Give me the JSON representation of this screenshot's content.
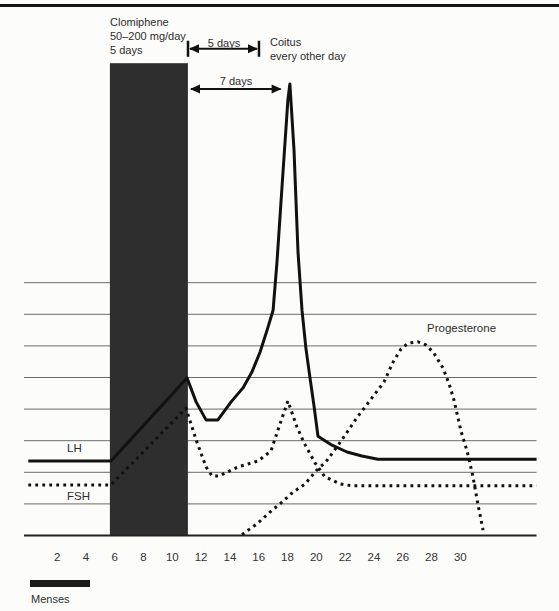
{
  "figure": {
    "annotations": {
      "clomiphene": {
        "line1": "Clomiphene",
        "line2": "50–200 mg/day",
        "line3": "5 days"
      },
      "five_days_arrow_label": "5 days",
      "coitus": {
        "line1": "Coitus",
        "line2": "every other day"
      },
      "seven_days_arrow_label": "7 days",
      "menses_label": "Menses"
    },
    "series_labels": {
      "lh": "LH",
      "fsh": "FSH",
      "progesterone": "Progesterone"
    },
    "colors": {
      "ink": "#111111",
      "treatment_bar": "#2e2e2e",
      "gridline": "#6b6b6b",
      "page": "#fcfcfa"
    }
  },
  "chart_data": {
    "type": "line",
    "title": "",
    "xlabel": "",
    "ylabel": "",
    "x_axis": {
      "ticks": [
        2,
        4,
        6,
        8,
        10,
        12,
        14,
        16,
        18,
        20,
        22,
        24,
        26,
        28,
        30
      ],
      "unit": "cycle day",
      "range": [
        0,
        35.3
      ]
    },
    "y_axis": {
      "gridline_levels": [
        7,
        14,
        21,
        28,
        35,
        42,
        49,
        56
      ],
      "range": [
        0,
        100
      ],
      "note": "relative hormone level, unlabeled axis"
    },
    "grid": "horizontal-only",
    "legend_position": "inline-labels",
    "series": [
      {
        "name": "LH",
        "style": "solid",
        "points": [
          [
            0,
            16.5
          ],
          [
            5.74,
            16.5
          ],
          [
            11.02,
            34.9
          ],
          [
            11.65,
            29.6
          ],
          [
            12.34,
            25.6
          ],
          [
            13.17,
            25.6
          ],
          [
            14.08,
            29.6
          ],
          [
            14.91,
            32.7
          ],
          [
            15.53,
            36.2
          ],
          [
            16.09,
            40.6
          ],
          [
            16.58,
            45.5
          ],
          [
            17.0,
            49.9
          ],
          [
            17.27,
            60.6
          ],
          [
            17.69,
            80.5
          ],
          [
            18.03,
            96.5
          ],
          [
            18.17,
            100
          ],
          [
            18.45,
            85.4
          ],
          [
            18.73,
            62.8
          ],
          [
            19.01,
            49.9
          ],
          [
            19.28,
            41.5
          ],
          [
            19.56,
            34.9
          ],
          [
            19.84,
            28.7
          ],
          [
            20.12,
            22.0
          ],
          [
            21.09,
            20.0
          ],
          [
            22.13,
            18.5
          ],
          [
            23.17,
            17.6
          ],
          [
            24.28,
            16.9
          ],
          [
            35.3,
            16.9
          ]
        ]
      },
      {
        "name": "FSH",
        "style": "dotted",
        "points": [
          [
            0,
            11.2
          ],
          [
            5.74,
            11.2
          ],
          [
            10.95,
            28.2
          ],
          [
            11.65,
            21.2
          ],
          [
            12.34,
            15.2
          ],
          [
            12.76,
            13.2
          ],
          [
            13.24,
            13.2
          ],
          [
            14.56,
            15.2
          ],
          [
            15.95,
            16.5
          ],
          [
            16.85,
            18.7
          ],
          [
            17.48,
            24.7
          ],
          [
            18.03,
            29.8
          ],
          [
            18.66,
            24.0
          ],
          [
            19.15,
            20.5
          ],
          [
            19.91,
            16.1
          ],
          [
            20.6,
            13.0
          ],
          [
            21.65,
            11.4
          ],
          [
            22.48,
            11.0
          ],
          [
            35.3,
            11.0
          ]
        ]
      },
      {
        "name": "Progesterone",
        "style": "dotted",
        "points": [
          [
            14.84,
            0.2
          ],
          [
            15.88,
            2.6
          ],
          [
            16.86,
            5.4
          ],
          [
            17.55,
            7.2
          ],
          [
            18.38,
            9.6
          ],
          [
            19.22,
            11.4
          ],
          [
            19.98,
            14.3
          ],
          [
            20.67,
            16.3
          ],
          [
            21.72,
            20.9
          ],
          [
            22.76,
            25.8
          ],
          [
            23.8,
            30.2
          ],
          [
            24.7,
            34.0
          ],
          [
            25.33,
            38.4
          ],
          [
            25.88,
            41.3
          ],
          [
            26.37,
            42.6
          ],
          [
            27.06,
            42.9
          ],
          [
            27.62,
            42.2
          ],
          [
            28.17,
            40.4
          ],
          [
            28.8,
            37.1
          ],
          [
            29.22,
            33.6
          ],
          [
            29.56,
            30.0
          ],
          [
            30.05,
            23.1
          ],
          [
            30.47,
            18.7
          ],
          [
            30.88,
            13.0
          ],
          [
            31.23,
            6.8
          ],
          [
            31.58,
            1.2
          ]
        ]
      }
    ],
    "treatment_bar": {
      "label": "Clomiphene 50–200 mg/day, 5 days",
      "day_start": 5.67,
      "day_end": 11.09,
      "top_level": 104.6
    },
    "arrows": [
      {
        "label": "5 days",
        "x0_day": 11.09,
        "x1_day": 16.02,
        "level": 107.8,
        "terminators": true
      },
      {
        "label": "7 days",
        "x0_day": 11.16,
        "x1_day": 17.66,
        "level": 98.9,
        "terminators": false
      }
    ],
    "menses_bar": {
      "label": "Menses",
      "day_start": 0.12,
      "day_end": 4.28
    }
  }
}
